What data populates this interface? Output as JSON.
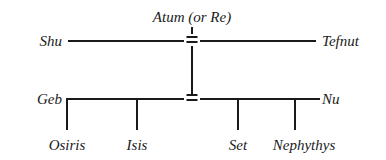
{
  "diagram": {
    "type": "family-tree",
    "title_label": "Atum (or Re)",
    "marriage_symbol": "=",
    "generations": [
      {
        "name": "generation-1",
        "left_label": "Shu",
        "right_label": "Tefnut",
        "parent_label": "Atum (or Re)"
      },
      {
        "name": "generation-2",
        "left_label": "Geb",
        "right_label": "Nu"
      },
      {
        "name": "generation-3",
        "children": [
          "Osiris",
          "Isis",
          "Set",
          "Nephythys"
        ]
      }
    ],
    "colors": {
      "ink": "#1a1a1a",
      "background": "#ffffff"
    }
  }
}
